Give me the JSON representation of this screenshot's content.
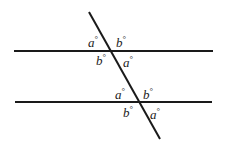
{
  "diagram": {
    "type": "parallel lines cut by transversal",
    "line_color": "#1a1a1a",
    "lines": [
      {
        "name": "top-parallel-line",
        "x1": 14,
        "y1": 51,
        "x2": 213,
        "y2": 51
      },
      {
        "name": "bottom-parallel-line",
        "x1": 15,
        "y1": 102,
        "x2": 212,
        "y2": 102
      },
      {
        "name": "transversal",
        "x1": 89,
        "y1": 12,
        "x2": 160,
        "y2": 139
      }
    ],
    "labels": {
      "top_upper_left": {
        "var": "a",
        "deg": "°"
      },
      "top_upper_right": {
        "var": "b",
        "deg": "°"
      },
      "top_lower_left": {
        "var": "b",
        "deg": "°"
      },
      "top_lower_right": {
        "var": "a",
        "deg": "°"
      },
      "bottom_upper_left": {
        "var": "a",
        "deg": "°"
      },
      "bottom_upper_right": {
        "var": "b",
        "deg": "°"
      },
      "bottom_lower_left": {
        "var": "b",
        "deg": "°"
      },
      "bottom_lower_right": {
        "var": "a",
        "deg": "°"
      }
    }
  }
}
